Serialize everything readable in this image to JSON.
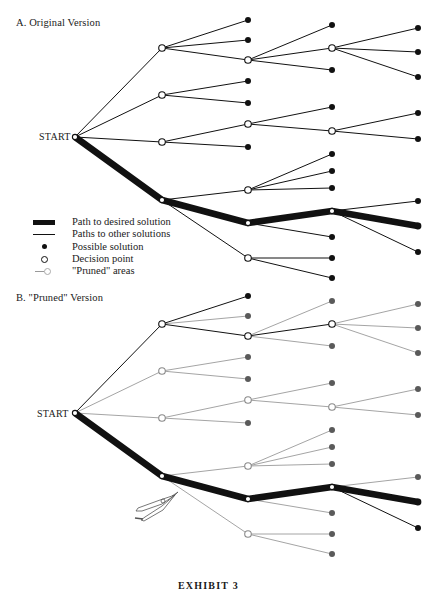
{
  "colors": {
    "ink": "#111111",
    "pruned_line": "#9a9a9a",
    "pruned_dot": "#5a5a5a",
    "background": "#ffffff"
  },
  "section_a": {
    "title": "A. Original Version",
    "start_label": "START"
  },
  "section_b": {
    "title": "B. \"Pruned\" Version",
    "start_label": "START"
  },
  "legend": {
    "items": [
      {
        "symbol": "thick-line",
        "label": "Path to desired solution"
      },
      {
        "symbol": "thin-line",
        "label": "Paths to other solutions"
      },
      {
        "symbol": "filled-dot",
        "label": "Possible solution"
      },
      {
        "symbol": "open-circle",
        "label": "Decision point"
      },
      {
        "symbol": "pruned-line",
        "label": "\"Pruned\" areas"
      }
    ]
  },
  "caption": "EXHIBIT 3",
  "tree": {
    "start": [
      75,
      137
    ],
    "nodes": {
      "d1a": [
        162,
        48
      ],
      "d1b": [
        162,
        95
      ],
      "d1c": [
        162,
        142
      ],
      "p1": [
        162,
        200
      ],
      "l_a1": [
        248,
        20
      ],
      "l_a2": [
        248,
        40
      ],
      "d2a": [
        248,
        60
      ],
      "l_a3": [
        332,
        25
      ],
      "d3a": [
        332,
        48
      ],
      "l_a4": [
        332,
        70
      ],
      "l_a5": [
        418,
        28
      ],
      "l_a6": [
        418,
        52
      ],
      "l_a7": [
        418,
        77
      ],
      "l_b1": [
        248,
        81
      ],
      "l_b2": [
        248,
        103
      ],
      "d2c": [
        248,
        124
      ],
      "l_c1": [
        248,
        147
      ],
      "l_c2": [
        332,
        107
      ],
      "d3c": [
        332,
        131
      ],
      "l_c3": [
        418,
        113
      ],
      "l_c4": [
        418,
        139
      ],
      "d2d": [
        248,
        190
      ],
      "p2": [
        248,
        223
      ],
      "d2e": [
        248,
        258
      ],
      "l_d1": [
        332,
        154
      ],
      "l_d2": [
        332,
        171
      ],
      "l_d3": [
        332,
        188
      ],
      "p3": [
        332,
        211
      ],
      "l_p1": [
        332,
        237
      ],
      "l_p2": [
        418,
        201
      ],
      "p4": [
        418,
        226
      ],
      "l_p3": [
        418,
        252
      ],
      "l_e1": [
        332,
        258
      ],
      "l_e2": [
        332,
        278
      ]
    },
    "decision_nodes": [
      "start",
      "d1a",
      "d1b",
      "d1c",
      "p1",
      "d2a",
      "d3a",
      "d2c",
      "d3c",
      "d2d",
      "p2",
      "d2e",
      "p3"
    ],
    "solution_nodes": [
      "l_a1",
      "l_a2",
      "l_a3",
      "l_a4",
      "l_a5",
      "l_a6",
      "l_a7",
      "l_b1",
      "l_b2",
      "l_c1",
      "l_c2",
      "l_c3",
      "l_c4",
      "l_d1",
      "l_d2",
      "l_d3",
      "l_p1",
      "l_p2",
      "l_p3",
      "l_e1",
      "l_e2"
    ],
    "path": [
      "start",
      "p1",
      "p2",
      "p3",
      "p4"
    ],
    "edges": [
      [
        "start",
        "d1a"
      ],
      [
        "start",
        "d1b"
      ],
      [
        "start",
        "d1c"
      ],
      [
        "d1a",
        "l_a1"
      ],
      [
        "d1a",
        "l_a2"
      ],
      [
        "d1a",
        "d2a"
      ],
      [
        "d2a",
        "l_a3"
      ],
      [
        "d2a",
        "d3a"
      ],
      [
        "d2a",
        "l_a4"
      ],
      [
        "d3a",
        "l_a5"
      ],
      [
        "d3a",
        "l_a6"
      ],
      [
        "d3a",
        "l_a7"
      ],
      [
        "d1b",
        "l_b1"
      ],
      [
        "d1b",
        "l_b2"
      ],
      [
        "d1c",
        "d2c"
      ],
      [
        "d1c",
        "l_c1"
      ],
      [
        "d2c",
        "l_c2"
      ],
      [
        "d2c",
        "d3c"
      ],
      [
        "d3c",
        "l_c3"
      ],
      [
        "d3c",
        "l_c4"
      ],
      [
        "p1",
        "d2d"
      ],
      [
        "p1",
        "d2e"
      ],
      [
        "d2d",
        "l_d1"
      ],
      [
        "d2d",
        "l_d2"
      ],
      [
        "d2d",
        "l_d3"
      ],
      [
        "p2",
        "l_p1"
      ],
      [
        "p3",
        "l_p2"
      ],
      [
        "p3",
        "l_p3"
      ],
      [
        "d2e",
        "l_e1"
      ],
      [
        "d2e",
        "l_e2"
      ]
    ],
    "kept_in_pruned_version": [
      [
        "start",
        "d1a"
      ],
      [
        "d1a",
        "l_a1"
      ],
      [
        "d1a",
        "d2a"
      ],
      [
        "d2a",
        "d3a"
      ],
      [
        "p3",
        "l_p3"
      ]
    ],
    "kept_nodes_in_pruned_version": [
      "l_a1",
      "l_p3"
    ],
    "pruned_version_offset_y": 276
  }
}
